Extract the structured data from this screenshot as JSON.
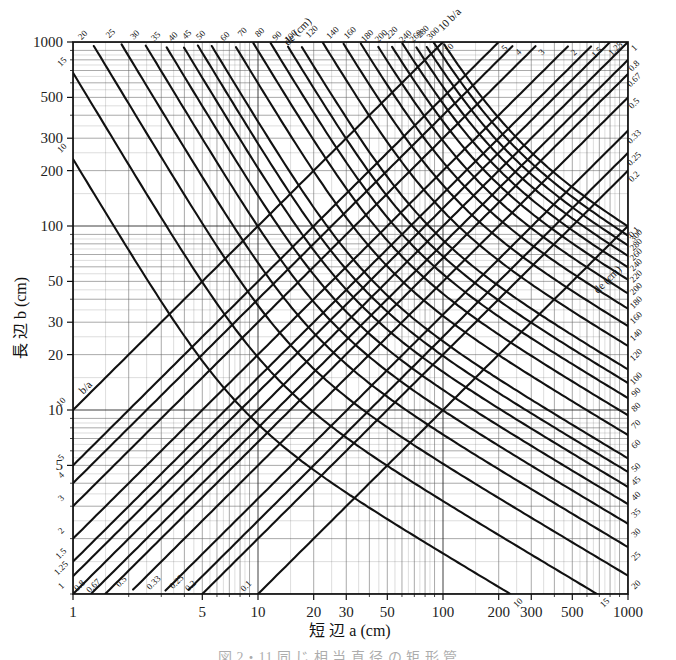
{
  "figure": {
    "title_caption": "図 2・11  同 じ 相 当 直 径 の 矩 形 管",
    "axes": {
      "x": {
        "label_prefix": "短 辺",
        "label_var": "a",
        "label_unit": "(cm)",
        "full_label": "短 辺 a (cm)",
        "scale": "log",
        "min": 1,
        "max": 1000,
        "major_ticks": [
          1,
          5,
          10,
          20,
          30,
          50,
          100,
          200,
          300,
          500,
          1000
        ],
        "major_tick_labels": [
          "1",
          "5",
          "10",
          "20",
          "30",
          "50",
          "100",
          "200",
          "300",
          "500",
          "1000"
        ]
      },
      "y": {
        "label_prefix": "長 辺",
        "label_var": "b",
        "label_unit": "(cm)",
        "full_label": "長 辺 b (cm)",
        "scale": "log",
        "min": 1,
        "max": 1000,
        "major_ticks": [
          5,
          10,
          20,
          30,
          50,
          100,
          200,
          300,
          500,
          1000
        ],
        "major_tick_labels": [
          "5",
          "10",
          "20",
          "30",
          "50",
          "100",
          "200",
          "300",
          "500",
          "1000"
        ]
      }
    },
    "family_labels": {
      "de_top": "de (cm)",
      "de_bottom": "de (cm)",
      "ba_top": "10 b/a",
      "ba_bottom": "b/a"
    }
  },
  "chart_data": {
    "type": "line",
    "subtype": "nomograph-log-log",
    "xlabel": "短 辺 a (cm)",
    "ylabel": "長 辺 b (cm)",
    "xscale": "log",
    "yscale": "log",
    "xlim": [
      1,
      1000
    ],
    "ylim": [
      1,
      1000
    ],
    "grid": true,
    "grid_style": "log-decade minor lines both axes",
    "legend": "inline rotated labels on curve ends",
    "series": [
      {
        "name": "de (equivalent diameter, cm) — contours running lower-left to upper-right",
        "kind": "equivalent-diameter-contour",
        "unit": "cm",
        "label_text": "de (cm)",
        "values": [
          10,
          15,
          20,
          25,
          30,
          35,
          40,
          45,
          50,
          60,
          70,
          80,
          90,
          100,
          120,
          140,
          160,
          180,
          200,
          220,
          240,
          260,
          280,
          300
        ],
        "labels": [
          "10",
          "15",
          "20",
          "25",
          "30",
          "35",
          "40",
          "45",
          "50",
          "60",
          "70",
          "80",
          "90",
          "100",
          "120",
          "140",
          "160",
          "180",
          "200",
          "220",
          "240",
          "260",
          "280",
          "300"
        ],
        "formula": "de = 1.30 (a·b)^0.625 / (a+b)^0.25",
        "orientation": "+45deg diagonal bands"
      },
      {
        "name": "b/a (aspect ratio) — contours running lower-left to upper-right parallel to diagonal",
        "kind": "aspect-ratio-contour",
        "unit": "ratio",
        "label_text": "b/a",
        "values": [
          10,
          5,
          4,
          3,
          2,
          1.5,
          1.25,
          1,
          0.8,
          0.67,
          0.5,
          0.33,
          0.25,
          0.2,
          0.1
        ],
        "labels": [
          "10",
          "5",
          "4",
          "3",
          "2",
          "1.5",
          "1.25",
          "1",
          "0.8",
          "0.67",
          "0.5",
          "0.33",
          "0.25",
          "0.2",
          "0.1"
        ],
        "formula": "b = (b/a) · a",
        "orientation": "-45deg diagonal family (constant ratio lines)"
      }
    ],
    "annotations": [
      {
        "text": "de (cm)",
        "location": "upper-left diagonal terminus"
      },
      {
        "text": "10 b/a",
        "location": "top-right of de ladder"
      },
      {
        "text": "de (cm)",
        "location": "lower-right diagonal terminus"
      },
      {
        "text": "b/a",
        "location": "lower-left of ratio family"
      }
    ]
  }
}
